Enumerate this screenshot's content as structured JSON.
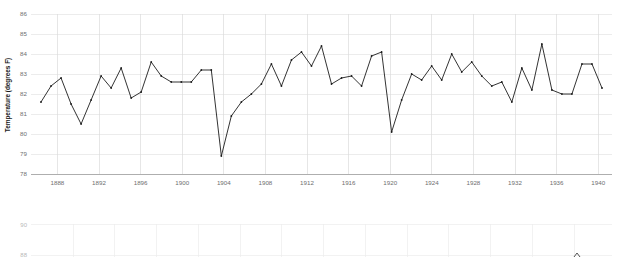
{
  "chart_data": [
    {
      "type": "line",
      "title": "",
      "subtitle": "",
      "xlabel": "",
      "ylabel": "Temperature (degrees F)",
      "xlim": [
        1884,
        1942
      ],
      "ylim": [
        78,
        86
      ],
      "grid": true,
      "legend": "none",
      "yticks": [
        78,
        79,
        80,
        81,
        82,
        83,
        84,
        85,
        86
      ],
      "xticks": [
        1888,
        1892,
        1896,
        1900,
        1904,
        1908,
        1912,
        1916,
        1920,
        1924,
        1928,
        1932,
        1936,
        1940
      ],
      "marker": "dot",
      "line_color": "#1c1c1c",
      "x": [
        1885,
        1886,
        1887,
        1888,
        1889,
        1890,
        1891,
        1892,
        1893,
        1894,
        1895,
        1896,
        1897,
        1898,
        1899,
        1900,
        1901,
        1902,
        1903,
        1904,
        1905,
        1906,
        1907,
        1908,
        1909,
        1910,
        1911,
        1912,
        1913,
        1914,
        1915,
        1916,
        1917,
        1918,
        1919,
        1920,
        1921,
        1922,
        1923,
        1924,
        1925,
        1926,
        1927,
        1928,
        1929,
        1930,
        1931,
        1932,
        1933,
        1934,
        1935,
        1936,
        1937,
        1938,
        1939,
        1940,
        1941
      ],
      "y": [
        81.6,
        82.4,
        82.8,
        81.5,
        80.5,
        81.7,
        82.9,
        82.3,
        83.3,
        81.8,
        82.1,
        83.6,
        82.9,
        82.6,
        82.6,
        82.6,
        83.2,
        83.2,
        78.9,
        80.9,
        81.6,
        82.0,
        82.5,
        83.5,
        82.4,
        83.7,
        84.1,
        83.4,
        84.4,
        82.5,
        82.8,
        82.9,
        82.4,
        83.9,
        84.1,
        80.1,
        81.7,
        83.0,
        82.7,
        83.4,
        82.7,
        84.0,
        83.1,
        83.6,
        82.9,
        82.4,
        82.6,
        81.6,
        83.3,
        82.2,
        84.5,
        82.2,
        82.0,
        82.0,
        83.5,
        83.5,
        82.3
      ]
    },
    {
      "type": "line",
      "title": "",
      "xlabel": "",
      "ylabel": "",
      "ylim": [
        88,
        90
      ],
      "grid": true,
      "legend": "none",
      "yticks": [
        90,
        88
      ],
      "xticks": [],
      "x": [],
      "y": [],
      "note": "partially visible lower chart (cropped)"
    }
  ],
  "chart1": {
    "ylabel": "Temperature (degrees F)",
    "yticks": [
      "86",
      "85",
      "84",
      "83",
      "82",
      "81",
      "80",
      "79",
      "78"
    ],
    "xticks": [
      "1888",
      "1892",
      "1896",
      "1900",
      "1904",
      "1908",
      "1912",
      "1916",
      "1920",
      "1924",
      "1928",
      "1932",
      "1936",
      "1940"
    ]
  },
  "chart2": {
    "yticks": [
      "90",
      "88"
    ]
  }
}
